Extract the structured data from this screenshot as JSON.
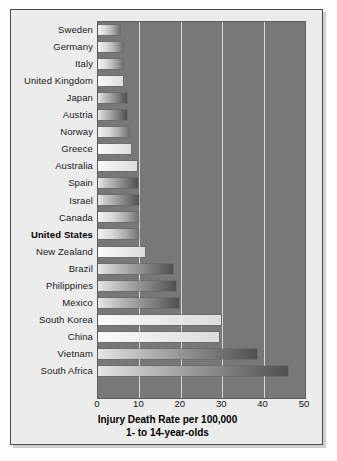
{
  "chart_data": {
    "type": "bar",
    "orientation": "horizontal",
    "title": "",
    "xlabel": "Injury Death Rate per 100,000",
    "xlabel_line2": "1- to 14-year-olds",
    "ylabel": "",
    "xlim": [
      0,
      50
    ],
    "xticks": [
      "0",
      "10",
      "20",
      "30",
      "40",
      "50"
    ],
    "xtick_values": [
      0,
      10,
      20,
      30,
      40,
      50
    ],
    "grid": "vertical-white",
    "legend": "none",
    "categories": [
      "Sweden",
      "Germany",
      "Italy",
      "United Kingdom",
      "Japan",
      "Austria",
      "Norway",
      "Greece",
      "Australia",
      "Spain",
      "Israel",
      "Canada",
      "United States",
      "New Zealand",
      "Brazil",
      "Philippines",
      "Mexico",
      "South Korea",
      "China",
      "Vietnam",
      "South Africa"
    ],
    "values": [
      5.2,
      6.0,
      6.1,
      6.1,
      7.0,
      7.0,
      7.6,
      8.0,
      9.5,
      9.6,
      9.8,
      9.8,
      9.9,
      11.3,
      18.0,
      18.8,
      19.5,
      29.6,
      29.2,
      38.5,
      45.9
    ],
    "highlight_category": "United States",
    "plot_background": "#787878",
    "gridline_color": "#e8e8e8",
    "bar_gradient_from": "#f2f2f2",
    "bar_gradient_to": "#6f6f6f"
  }
}
